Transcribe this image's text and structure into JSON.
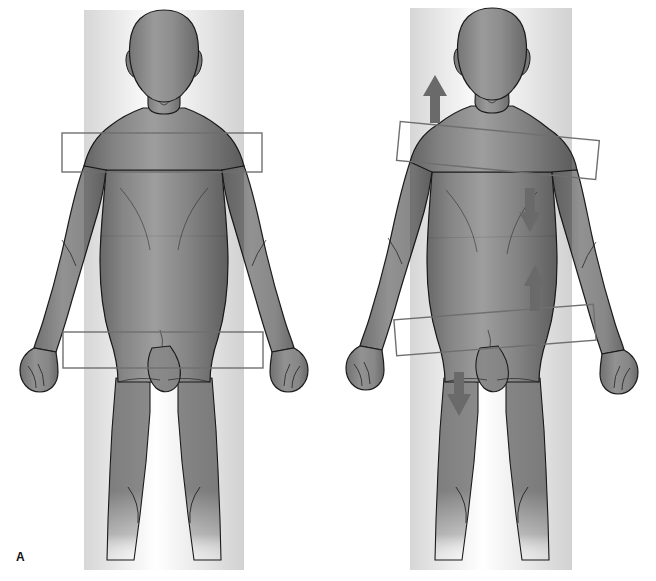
{
  "figure": {
    "width": 656,
    "height": 581,
    "background_color": "#ffffff"
  },
  "colors": {
    "body_fill": "#8a8a8a",
    "body_fill_light": "#9c9c9c",
    "body_fill_dark": "#6e6e6e",
    "body_outline": "#1c1c1c",
    "box_stroke": "#6f6f6f",
    "arrow_fill": "#6a6a6a",
    "label_text": "#111111",
    "background": "#ffffff"
  },
  "panels": [
    {
      "id": "a",
      "label": "A",
      "caption": "A",
      "description": "Anterior view of body with level shoulder girdle box and level pelvic girdle box",
      "alignment_state": "level",
      "boxes": [
        {
          "name": "shoulder-girdle-box",
          "region": "shoulder girdle",
          "x": 62,
          "y": 133,
          "width": 200,
          "height": 39,
          "tilt_degrees": 0
        },
        {
          "name": "pelvic-girdle-box",
          "region": "pelvic girdle",
          "x": 63,
          "y": 332,
          "width": 200,
          "height": 36,
          "tilt_degrees": 0
        }
      ],
      "arrows": []
    },
    {
      "id": "b",
      "label": "B",
      "caption": "B",
      "description": "Anterior view of body with tilted shoulder girdle box and oppositely tilted pelvic girdle box, with directional force arrows",
      "alignment_state": "tilted",
      "boxes": [
        {
          "name": "shoulder-girdle-box",
          "region": "shoulder girdle",
          "x": 70,
          "y": 131,
          "width": 200,
          "height": 39,
          "tilt_degrees": 5.5
        },
        {
          "name": "pelvic-girdle-box",
          "region": "pelvic girdle",
          "x": 67,
          "y": 312,
          "width": 200,
          "height": 36,
          "tilt_degrees": -4.5
        }
      ],
      "arrows": [
        {
          "name": "shoulder-elevation-arrow",
          "direction": "up",
          "region": "left shoulder / neck",
          "x": 97,
          "y": 75,
          "width": 20,
          "height": 48
        },
        {
          "name": "chest-depression-arrow",
          "direction": "down",
          "region": "right chest",
          "x": 192,
          "y": 188,
          "width": 20,
          "height": 44
        },
        {
          "name": "flank-elevation-arrow",
          "direction": "up",
          "region": "right flank / abdomen",
          "x": 197,
          "y": 265,
          "width": 20,
          "height": 46
        },
        {
          "name": "thigh-depression-arrow",
          "direction": "down",
          "region": "left thigh",
          "x": 120,
          "y": 372,
          "width": 22,
          "height": 44
        }
      ]
    }
  ]
}
